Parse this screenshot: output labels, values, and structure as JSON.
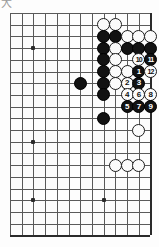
{
  "diagram": {
    "type": "go-board-problem-diagram",
    "corner_mark": "大",
    "board": {
      "cols": 13,
      "rows": 20,
      "origin_x": 10,
      "origin_y": 13,
      "spacing": 11.7,
      "right_edge_is_board_edge": true,
      "bottom_edge_is_board_edge": true,
      "left_edge_is_board_edge": false,
      "top_edge_is_board_edge": false,
      "star_points": [
        {
          "col": 2,
          "row": 3
        },
        {
          "col": 2,
          "row": 11
        },
        {
          "col": 2,
          "row": 16
        },
        {
          "col": 8,
          "row": 16
        }
      ]
    },
    "stones": [
      {
        "col": 8,
        "row": 1,
        "color": "white"
      },
      {
        "col": 9,
        "row": 1,
        "color": "white"
      },
      {
        "col": 8,
        "row": 2,
        "color": "black"
      },
      {
        "col": 9,
        "row": 2,
        "color": "black"
      },
      {
        "col": 10,
        "row": 2,
        "color": "white"
      },
      {
        "col": 11,
        "row": 2,
        "color": "white"
      },
      {
        "col": 12,
        "row": 2,
        "color": "white"
      },
      {
        "col": 8,
        "row": 3,
        "color": "black"
      },
      {
        "col": 9,
        "row": 3,
        "color": "white"
      },
      {
        "col": 10,
        "row": 3,
        "color": "black"
      },
      {
        "col": 11,
        "row": 3,
        "color": "black"
      },
      {
        "col": 12,
        "row": 3,
        "color": "black"
      },
      {
        "col": 8,
        "row": 4,
        "color": "black"
      },
      {
        "col": 9,
        "row": 4,
        "color": "white"
      },
      {
        "col": 8,
        "row": 5,
        "color": "black"
      },
      {
        "col": 9,
        "row": 5,
        "color": "white"
      },
      {
        "col": 10,
        "row": 5,
        "color": "white"
      },
      {
        "col": 6,
        "row": 6,
        "color": "black"
      },
      {
        "col": 8,
        "row": 6,
        "color": "black"
      },
      {
        "col": 9,
        "row": 6,
        "color": "white"
      },
      {
        "col": 10,
        "row": 6,
        "color": "white"
      },
      {
        "col": 8,
        "row": 7,
        "color": "black"
      },
      {
        "col": 8,
        "row": 9,
        "color": "black"
      },
      {
        "col": 11,
        "row": 10,
        "color": "white"
      },
      {
        "col": 9,
        "row": 13,
        "color": "white"
      },
      {
        "col": 10,
        "row": 13,
        "color": "white"
      },
      {
        "col": 11,
        "row": 13,
        "color": "white"
      }
    ],
    "moves": [
      {
        "num": "1",
        "col": 11,
        "row": 5,
        "color": "black"
      },
      {
        "num": "2",
        "col": 10,
        "row": 6,
        "color": "white"
      },
      {
        "num": "3",
        "col": 11,
        "row": 6,
        "color": "black"
      },
      {
        "num": "4",
        "col": 10,
        "row": 7,
        "color": "white"
      },
      {
        "num": "5",
        "col": 10,
        "row": 8,
        "color": "black"
      },
      {
        "num": "6",
        "col": 11,
        "row": 7,
        "color": "white"
      },
      {
        "num": "7",
        "col": 11,
        "row": 8,
        "color": "black"
      },
      {
        "num": "8",
        "col": 12,
        "row": 7,
        "color": "white"
      },
      {
        "num": "9",
        "col": 12,
        "row": 8,
        "color": "black"
      },
      {
        "num": "10",
        "col": 11,
        "row": 4,
        "color": "white"
      },
      {
        "num": "11",
        "col": 12,
        "row": 4,
        "color": "black"
      },
      {
        "num": "12",
        "col": 12,
        "row": 5,
        "color": "white"
      }
    ]
  }
}
